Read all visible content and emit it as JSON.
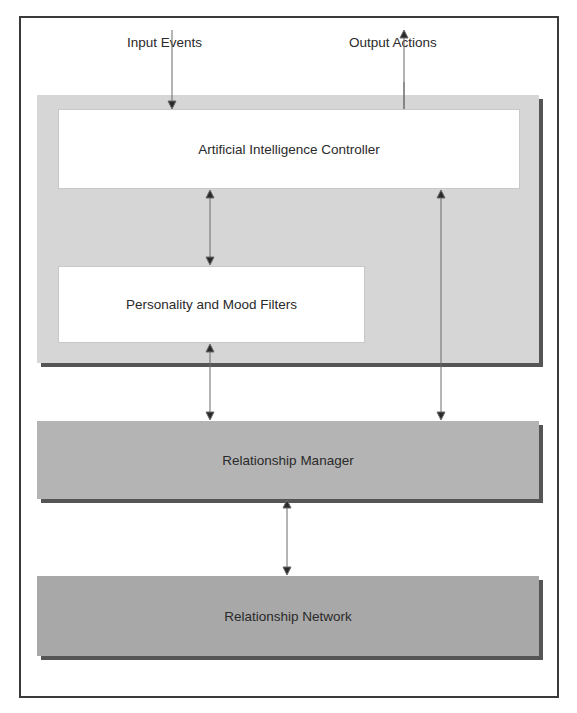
{
  "diagram": {
    "labels": {
      "input": "Input Events",
      "output": "Output Actions"
    },
    "boxes": {
      "ai_controller": "Artificial Intelligence Controller",
      "personality_filters": "Personality and Mood Filters",
      "relationship_manager": "Relationship Manager",
      "relationship_network": "Relationship Network"
    },
    "connections": [
      {
        "from": "Input Events",
        "to": "Artificial Intelligence Controller",
        "direction": "one-way"
      },
      {
        "from": "Artificial Intelligence Controller",
        "to": "Output Actions",
        "direction": "one-way"
      },
      {
        "from": "Artificial Intelligence Controller",
        "to": "Personality and Mood Filters",
        "direction": "two-way"
      },
      {
        "from": "Personality and Mood Filters",
        "to": "Relationship Manager",
        "direction": "two-way"
      },
      {
        "from": "Artificial Intelligence Controller",
        "to": "Relationship Manager",
        "direction": "two-way"
      },
      {
        "from": "Relationship Manager",
        "to": "Relationship Network",
        "direction": "two-way"
      }
    ],
    "colors": {
      "group_fill": "#d6d6d6",
      "manager_fill": "#b4b4b4",
      "network_fill": "#a8a8a8",
      "border": "#3a3a3a"
    }
  }
}
